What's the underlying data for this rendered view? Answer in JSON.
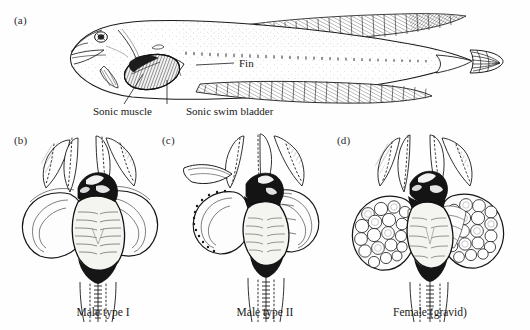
{
  "figure": {
    "background_color": "#fefefe",
    "ink_color": "#1a1a1a"
  },
  "panels": [
    {
      "letter": "(a)",
      "name": "lateral-fish-view",
      "caption": "",
      "annotations": [
        {
          "name": "fin-label",
          "text": "Fin"
        },
        {
          "name": "sonic-muscle-label",
          "text": "Sonic muscle"
        },
        {
          "name": "sonic-swim-bladder-label",
          "text": "Sonic swim bladder"
        }
      ]
    },
    {
      "letter": "(b)",
      "name": "male-type-i-view",
      "caption": "Male type I",
      "annotations": []
    },
    {
      "letter": "(c)",
      "name": "male-type-ii-view",
      "caption": "Male type II",
      "annotations": []
    },
    {
      "letter": "(d)",
      "name": "female-gravid-view",
      "caption": "Female (gravid)",
      "annotations": []
    }
  ]
}
